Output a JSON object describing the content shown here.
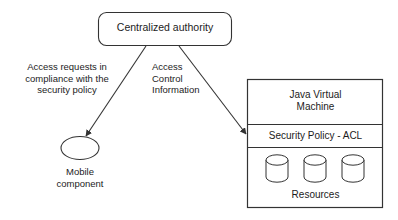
{
  "diagram": {
    "colors": {
      "stroke": "#333333",
      "text": "#1c1c1c",
      "background": "#ffffff",
      "fill": "#ffffff"
    },
    "nodes": {
      "authority": {
        "label": "Centralized authority",
        "shape": "rounded-rectangle"
      },
      "mobile_component": {
        "label": "Mobile\ncomponent",
        "shape": "ellipse"
      },
      "jvm_panel": {
        "shape": "rectangle-stack",
        "bands": [
          {
            "label": "Java Virtual\nMachine",
            "name": "java-virtual-machine"
          },
          {
            "label": "Security Policy - ACL",
            "name": "security-policy-acl"
          },
          {
            "label": "Resources",
            "name": "resources"
          }
        ],
        "resource_count": 3,
        "resource_shape": "cylinder"
      }
    },
    "edges": [
      {
        "name": "authority-to-mobile-component",
        "label": "Access requests in\ncompliance with the\nsecurity policy",
        "from": "authority",
        "to": "mobile_component",
        "arrow": "end"
      },
      {
        "name": "authority-to-security-policy",
        "label": "Access\nControl\nInformation",
        "from": "authority",
        "to": "jvm_panel",
        "arrow": "end"
      }
    ]
  }
}
